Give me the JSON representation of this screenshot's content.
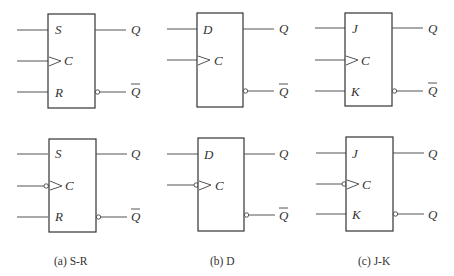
{
  "figure": {
    "flipflops": [
      {
        "caption": "(a) S-R",
        "top": {
          "inputs": [
            "S",
            "C",
            "R"
          ],
          "outputs": [
            "Q",
            "Q"
          ],
          "clock_inverted": false,
          "q2_overbar": true
        },
        "bottom": {
          "inputs": [
            "S",
            "C",
            "R"
          ],
          "outputs": [
            "Q",
            "Q"
          ],
          "clock_inverted": true,
          "q2_overbar": true
        }
      },
      {
        "caption": "(b) D",
        "top": {
          "inputs": [
            "D",
            "C"
          ],
          "outputs": [
            "Q",
            "Q"
          ],
          "clock_inverted": false,
          "q2_overbar": true
        },
        "bottom": {
          "inputs": [
            "D",
            "C"
          ],
          "outputs": [
            "Q",
            "Q"
          ],
          "clock_inverted": true,
          "q2_overbar": true
        }
      },
      {
        "caption": "(c) J-K",
        "top": {
          "inputs": [
            "J",
            "C",
            "K"
          ],
          "outputs": [
            "Q",
            "Q"
          ],
          "clock_inverted": false,
          "q2_overbar": true
        },
        "bottom": {
          "inputs": [
            "J",
            "C",
            "K"
          ],
          "outputs": [
            "Q",
            "Q"
          ],
          "clock_inverted": true,
          "q2_overbar": false
        }
      }
    ]
  }
}
